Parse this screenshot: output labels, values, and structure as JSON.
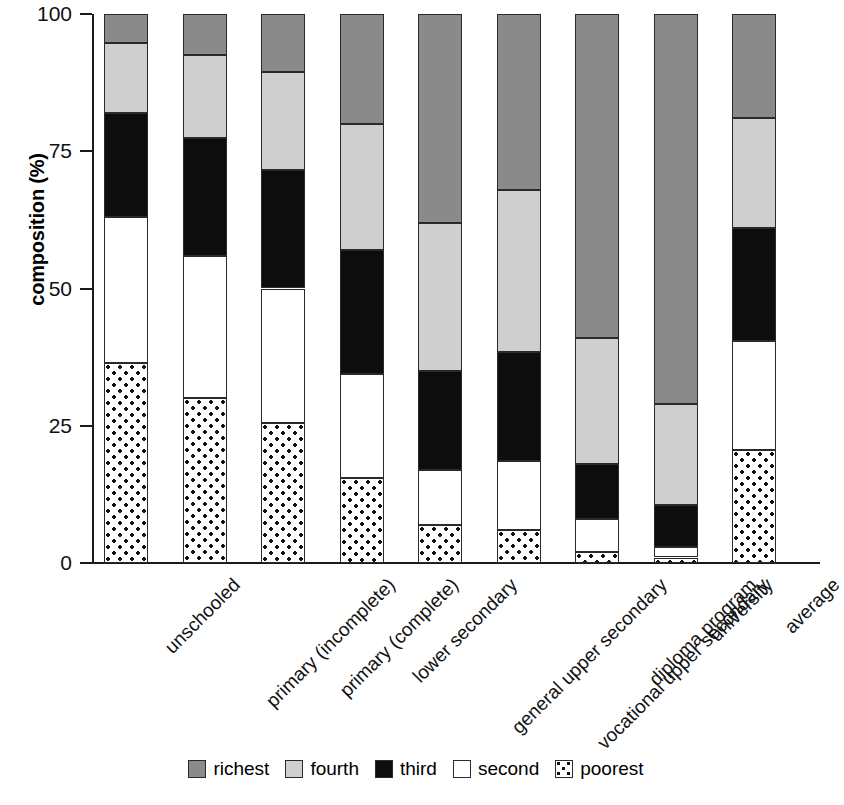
{
  "chart_data": {
    "type": "bar",
    "subtype": "stacked-bar-100",
    "title": "",
    "xlabel": "",
    "ylabel": "composition (%)",
    "ylim": [
      0,
      100
    ],
    "yticks": [
      0,
      25,
      50,
      75,
      100
    ],
    "ytick_labels": [
      "0",
      "25",
      "50",
      "75",
      "100"
    ],
    "grid": false,
    "legend_position": "bottom",
    "categories": [
      "unschooled",
      "primary (incomplete)",
      "primary (complete)",
      "lower secondary",
      "general upper secondary",
      "vocational upper secondary",
      "diploma program",
      "university",
      "average"
    ],
    "series": [
      {
        "name": "poorest",
        "fill": "dotted",
        "color": "#ffffff",
        "values": [
          36.5,
          30.0,
          25.5,
          15.5,
          7.0,
          6.0,
          2.0,
          1.0,
          20.5
        ]
      },
      {
        "name": "second",
        "fill": "solid",
        "color": "#ffffff",
        "values": [
          26.5,
          26.0,
          24.5,
          19.0,
          10.0,
          12.5,
          6.0,
          2.0,
          20.0
        ]
      },
      {
        "name": "third",
        "fill": "solid",
        "color": "#0d0d0d",
        "values": [
          19.0,
          21.5,
          21.5,
          22.5,
          18.0,
          20.0,
          10.0,
          7.5,
          20.5
        ]
      },
      {
        "name": "fourth",
        "fill": "solid",
        "color": "#cfcfcf",
        "values": [
          12.7,
          15.0,
          18.0,
          23.0,
          27.0,
          29.5,
          23.0,
          18.5,
          20.0
        ]
      },
      {
        "name": "richest",
        "fill": "solid",
        "color": "#8a8a8a",
        "values": [
          5.3,
          7.5,
          10.5,
          20.0,
          38.0,
          32.0,
          59.0,
          71.0,
          19.0
        ]
      }
    ],
    "cumulative_boundaries": {
      "note": "top edge of each stack segment in percent, bottom to top",
      "unschooled": [
        36.5,
        63.0,
        82.0,
        94.7,
        100
      ],
      "primary (incomplete)": [
        30.0,
        56.0,
        77.5,
        92.5,
        100
      ],
      "primary (complete)": [
        25.5,
        50.0,
        71.5,
        89.5,
        100
      ],
      "lower secondary": [
        15.5,
        34.5,
        57.0,
        80.0,
        100
      ],
      "general upper secondary": [
        7.0,
        17.0,
        35.0,
        62.0,
        100
      ],
      "vocational upper secondary": [
        6.0,
        18.5,
        38.5,
        68.0,
        100
      ],
      "diploma program": [
        2.0,
        8.0,
        18.0,
        41.0,
        100
      ],
      "university": [
        1.0,
        3.0,
        10.5,
        29.0,
        100
      ],
      "average": [
        20.5,
        40.5,
        61.0,
        81.0,
        100
      ]
    },
    "legend": [
      {
        "label": "richest",
        "key": "richest"
      },
      {
        "label": "fourth",
        "key": "fourth"
      },
      {
        "label": "third",
        "key": "third"
      },
      {
        "label": "second",
        "key": "second"
      },
      {
        "label": "poorest",
        "key": "poorest"
      }
    ]
  }
}
